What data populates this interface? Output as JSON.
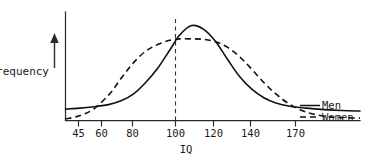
{
  "figure": {
    "background_color": "#ffffff",
    "ink_color": "#111111"
  },
  "chart_data": {
    "type": "line",
    "title": "",
    "subtitle": "",
    "xlabel": "IQ",
    "ylabel": "Frequency",
    "grid": false,
    "legend_position": "right-inline",
    "xlim": [
      38,
      185
    ],
    "ylim": [
      0,
      1.08
    ],
    "xticks": [
      45,
      60,
      80,
      100,
      120,
      140,
      170
    ],
    "xticklabels": [
      "45",
      "60",
      "80",
      "100",
      "120",
      "140",
      "170"
    ],
    "yticks": [],
    "yticklabels": [],
    "annotations": [
      {
        "name": "mean-dashed-line",
        "text": "",
        "x": 100,
        "style": "vertical dashed line from axis to peak of Men curve"
      }
    ],
    "series": [
      {
        "name": "Men",
        "style": "solid",
        "peak_x": 101,
        "peak_y": 1.0,
        "spread": "narrow",
        "x": [
          38,
          45,
          52,
          60,
          66,
          72,
          78,
          84,
          90,
          95,
          101,
          107,
          113,
          119,
          125,
          131,
          137,
          143,
          150,
          158,
          167,
          176,
          185
        ],
        "y": [
          0.12,
          0.13,
          0.145,
          0.17,
          0.21,
          0.28,
          0.4,
          0.55,
          0.74,
          0.9,
          1.0,
          0.96,
          0.83,
          0.64,
          0.46,
          0.33,
          0.24,
          0.185,
          0.15,
          0.13,
          0.115,
          0.105,
          0.1
        ]
      },
      {
        "name": "Women",
        "style": "dashed",
        "peak_x": 100,
        "peak_y": 0.86,
        "spread": "wide",
        "x": [
          38,
          45,
          52,
          60,
          66,
          72,
          78,
          84,
          90,
          95,
          101,
          107,
          113,
          119,
          125,
          131,
          137,
          143,
          150,
          158,
          167,
          176,
          185
        ],
        "y": [
          0.015,
          0.05,
          0.12,
          0.28,
          0.45,
          0.61,
          0.73,
          0.8,
          0.845,
          0.86,
          0.86,
          0.855,
          0.83,
          0.77,
          0.67,
          0.54,
          0.4,
          0.28,
          0.17,
          0.09,
          0.045,
          0.03,
          0.025
        ]
      }
    ],
    "legend": [
      {
        "label": "Men",
        "style": "solid"
      },
      {
        "label": "Women",
        "style": "dashed"
      }
    ]
  }
}
